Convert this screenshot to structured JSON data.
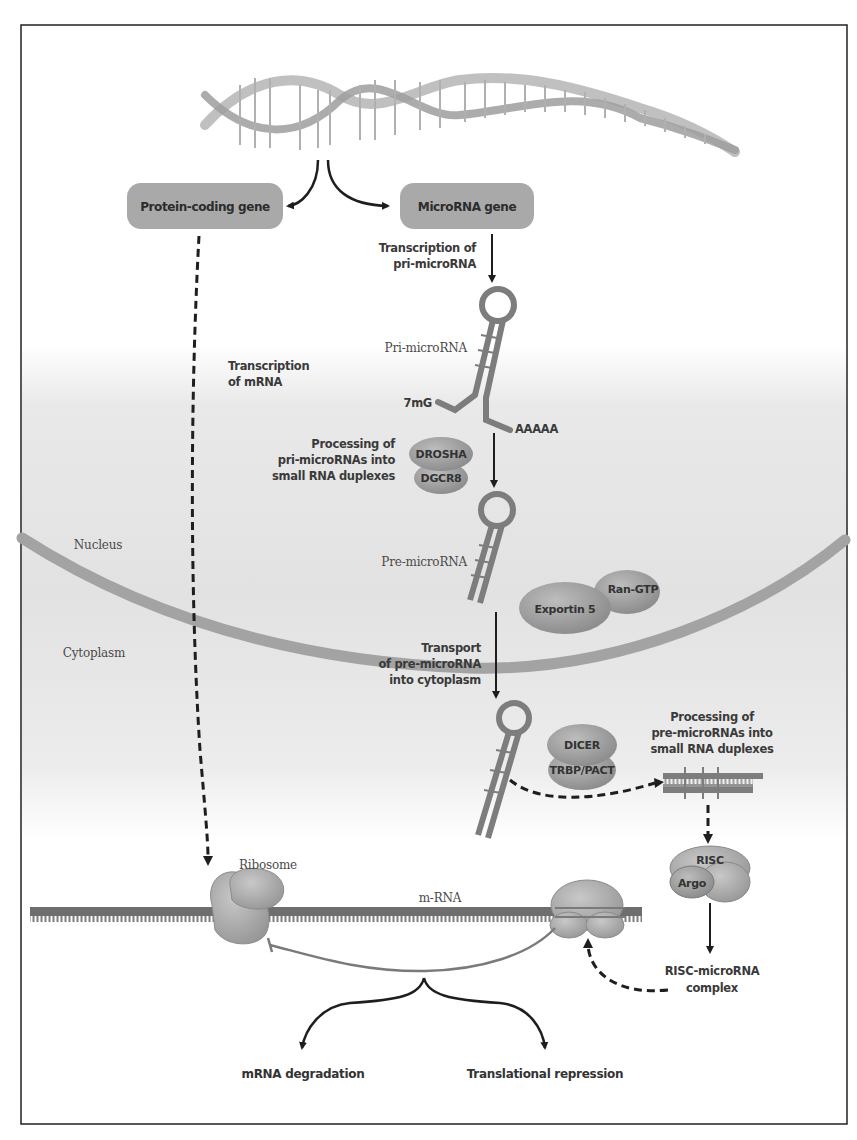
{
  "figure": {
    "colors": {
      "frame": "#222222",
      "gene_box": "#a9a9a9",
      "rna_strand": "#7d7d7d",
      "membrane": "#9a9a9a",
      "protein": "#8f8f8f",
      "background_gray": "#dcdcdc",
      "arrow": "#1e1e1e"
    },
    "regions": {
      "nucleus": "Nucleus",
      "cytoplasm": "Cytoplasm"
    },
    "genes": {
      "protein_coding": "Protein-coding gene",
      "microrna": "MicroRNA gene"
    },
    "steps": {
      "transcription_pri_line1": "Transcription of",
      "transcription_pri_line2": "pri-microRNA",
      "transcription_mrna_line1": "Transcription",
      "transcription_mrna_line2": "of mRNA",
      "processing_nuc_line1": "Processing of",
      "processing_nuc_line2": "pri-microRNAs into",
      "processing_nuc_line3": "small RNA duplexes",
      "transport_line1": "Transport",
      "transport_line2": "of pre-microRNA",
      "transport_line3": "into cytoplasm",
      "processing_cyt_line1": "Processing of",
      "processing_cyt_line2": "pre-microRNAs into",
      "processing_cyt_line3": "small RNA duplexes",
      "risc_complex_line1": "RISC-microRNA",
      "risc_complex_line2": "complex"
    },
    "molecules": {
      "pri_microrna": "Pri-microRNA",
      "pre_microrna": "Pre-microRNA",
      "cap": "7mG",
      "polya": "AAAAA",
      "ribosome": "Ribosome",
      "mrna": "m-RNA"
    },
    "proteins": {
      "drosha": "DROSHA",
      "dgcr8": "DGCR8",
      "exportin": "Exportin 5",
      "ran_gtp": "Ran-GTP",
      "dicer": "DICER",
      "trbp": "TRBP/PACT",
      "risc": "RISC",
      "argo": "Argo"
    },
    "outcomes": {
      "degradation": "mRNA degradation",
      "repression": "Translational repression"
    }
  }
}
